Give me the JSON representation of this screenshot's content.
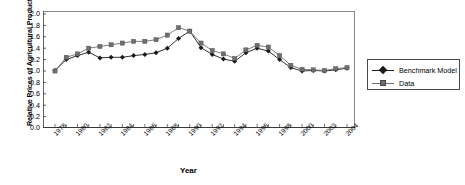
{
  "chart_data": {
    "type": "line",
    "title": "",
    "xlabel": "Year",
    "ylabel": "Relative Prices of Agricultural Products",
    "xlim": [
      1978,
      2004
    ],
    "ylim": [
      0.0,
      2.0
    ],
    "grid": false,
    "legend_position": "right",
    "x": [
      1978,
      1979,
      1980,
      1981,
      1982,
      1983,
      1984,
      1985,
      1986,
      1987,
      1988,
      1989,
      1990,
      1991,
      1992,
      1993,
      1994,
      1995,
      1996,
      1997,
      1998,
      1999,
      2000,
      2001,
      2002,
      2003,
      2004
    ],
    "ytick_labels": [
      "2.0",
      "1.8",
      "1.6",
      "1.4",
      "1.2",
      "1.0",
      "0.8",
      "0.6",
      "0.4",
      "0.2",
      "0.0"
    ],
    "ytick_values": [
      2.0,
      1.8,
      1.6,
      1.4,
      1.2,
      1.0,
      0.8,
      0.6,
      0.4,
      0.2,
      0.0
    ],
    "xtick_labels": [
      "1978",
      "1980",
      "1982",
      "1984",
      "1986",
      "1988",
      "1990",
      "1992",
      "1994",
      "1996",
      "1998",
      "2000",
      "2002",
      "2004"
    ],
    "xtick_values": [
      1978,
      1980,
      1982,
      1984,
      1986,
      1988,
      1990,
      1992,
      1994,
      1996,
      1998,
      2000,
      2002,
      2004
    ],
    "series": [
      {
        "name": "Benchmark Model",
        "color": "#1a1a1a",
        "marker": "diamond",
        "values": [
          1.01,
          1.2,
          1.27,
          1.33,
          1.23,
          1.24,
          1.24,
          1.27,
          1.29,
          1.32,
          1.4,
          1.57,
          1.7,
          1.41,
          1.29,
          1.21,
          1.17,
          1.32,
          1.4,
          1.35,
          1.2,
          1.06,
          1.0,
          1.01,
          1.0,
          1.02,
          1.05
        ]
      },
      {
        "name": "Data",
        "color": "#6e6e6e",
        "marker": "square",
        "values": [
          1.0,
          1.24,
          1.3,
          1.4,
          1.43,
          1.46,
          1.49,
          1.52,
          1.52,
          1.55,
          1.63,
          1.76,
          1.7,
          1.49,
          1.36,
          1.3,
          1.22,
          1.37,
          1.45,
          1.42,
          1.27,
          1.1,
          1.03,
          1.02,
          1.01,
          1.04,
          1.06
        ]
      }
    ]
  },
  "legend": {
    "items": [
      {
        "label": "Benchmark Model"
      },
      {
        "label": "Data"
      }
    ]
  }
}
